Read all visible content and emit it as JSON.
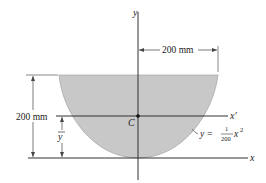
{
  "figure": {
    "axes": {
      "y_label": "y",
      "x_label": "x",
      "x_prime_label": "x'",
      "centroid_label": "C"
    },
    "dimensions": {
      "half_width": "200 mm",
      "height": "200 mm",
      "ybar": "y"
    },
    "curve_equation": {
      "lhs": "y =",
      "numerator": "1",
      "denominator": "200",
      "var": "x",
      "exponent": "2"
    },
    "colors": {
      "fill": "#c8c8c8",
      "stroke": "#333333",
      "background": "#ffffff"
    }
  }
}
